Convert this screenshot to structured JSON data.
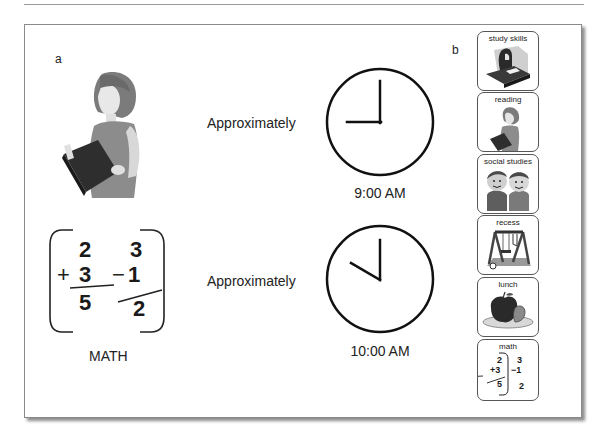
{
  "panel_a": {
    "label": "a",
    "rows": [
      {
        "activity_image": "woman-reading-book",
        "approx_label": "Approximately",
        "time": "9:00 AM"
      },
      {
        "activity_image": "math-problems",
        "approx_label": "Approximately",
        "time": "10:00 AM",
        "caption": "MATH"
      }
    ],
    "math": {
      "addition": {
        "top": "2",
        "operator": "+",
        "bottom": "3",
        "result": "5"
      },
      "subtraction": {
        "top": "3",
        "operator": "−",
        "bottom": "1",
        "result": "2"
      }
    }
  },
  "panel_b": {
    "label": "b",
    "schedule": [
      {
        "label": "study skills",
        "icon": "student-at-desk"
      },
      {
        "label": "reading",
        "icon": "woman-reading"
      },
      {
        "label": "social studies",
        "icon": "two-children"
      },
      {
        "label": "recess",
        "icon": "swing-set"
      },
      {
        "label": "lunch",
        "icon": "apple-on-plate"
      },
      {
        "label": "math",
        "icon": "math-problems"
      }
    ],
    "mini_math": {
      "a_top": "2",
      "a_bottom": "+3",
      "a_result": "5",
      "b_top": "3",
      "b_bottom": "−1",
      "b_result": "2"
    }
  }
}
